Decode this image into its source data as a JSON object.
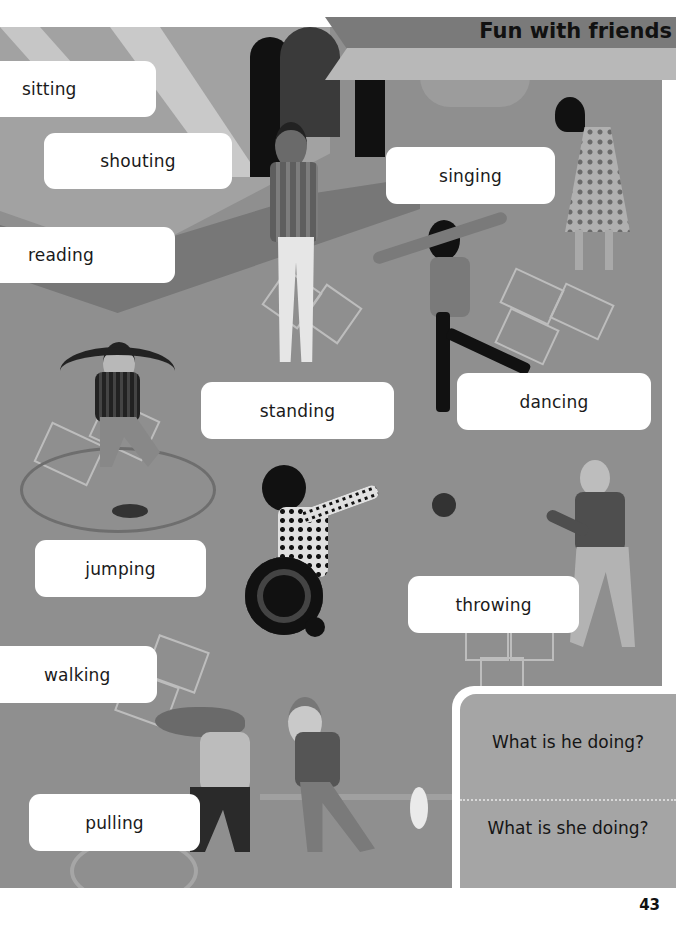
{
  "page": {
    "title": "Fun with friends",
    "page_number": "43"
  },
  "labels": {
    "sitting": "sitting",
    "shouting": "shouting",
    "singing": "singing",
    "reading": "reading",
    "standing": "standing",
    "dancing": "dancing",
    "jumping": "jumping",
    "throwing": "throwing",
    "walking": "walking",
    "pulling": "pulling"
  },
  "questions": {
    "he": "What is he doing?",
    "she": "What is she doing?"
  },
  "colors": {
    "scene_background": "#8f8f8f",
    "banner_dark": "#7a7a7a",
    "banner_light": "#b8b8b8",
    "question_panel": "#a5a5a5",
    "label_background": "#ffffff"
  }
}
